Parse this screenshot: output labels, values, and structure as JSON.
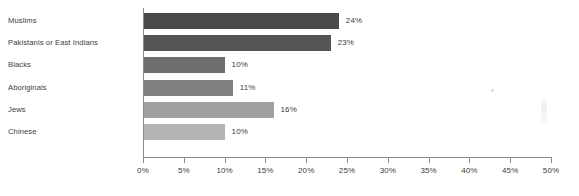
{
  "chart_data": {
    "type": "bar",
    "orientation": "horizontal",
    "title": "",
    "subtitle": "",
    "xlabel": "",
    "ylabel": "",
    "categories": [
      "Muslims",
      "Pakistanis or East Indians",
      "Blacks",
      "Aboriginals",
      "Jews",
      "Chinese"
    ],
    "values": [
      24,
      23,
      10,
      11,
      16,
      10
    ],
    "value_labels": [
      "24%",
      "23%",
      "10%",
      "11%",
      "16%",
      "10%"
    ],
    "bar_colors": [
      "#4a4a4a",
      "#555555",
      "#6e6e6e",
      "#7f7f7f",
      "#a0a0a0",
      "#b4b4b4"
    ],
    "xlim": [
      0,
      50
    ],
    "xticks": [
      0,
      5,
      10,
      15,
      20,
      25,
      30,
      35,
      40,
      45,
      50
    ],
    "xtick_labels": [
      "0%",
      "5%",
      "10%",
      "15%",
      "20%",
      "25%",
      "30%",
      "35%",
      "40%",
      "45%",
      "50%"
    ],
    "grid": false,
    "legend": "none",
    "value_label_position": "outside-end",
    "axis_color": "#8c8c8c",
    "text_color": "#3b3b3b",
    "background_color": "#ffffff"
  }
}
